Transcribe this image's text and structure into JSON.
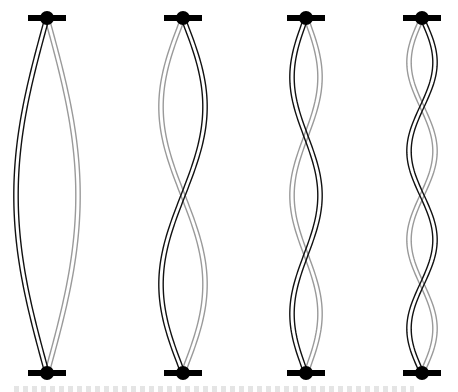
{
  "diagram": {
    "top_y": 18,
    "bottom_y": 373,
    "colors": {
      "phase_a": "#111111",
      "phase_b": "#9a9a9a",
      "anchor": "#000000",
      "background": "#ffffff"
    },
    "modes": [
      {
        "id": "mode-1",
        "harmonic": 1,
        "center_x": 47,
        "amplitude": 31,
        "first_lobe_black_side": "left"
      },
      {
        "id": "mode-2",
        "harmonic": 2,
        "center_x": 183,
        "amplitude": 22,
        "first_lobe_black_side": "right"
      },
      {
        "id": "mode-3",
        "harmonic": 3,
        "center_x": 306,
        "amplitude": 14,
        "first_lobe_black_side": "left"
      },
      {
        "id": "mode-4",
        "harmonic": 4,
        "center_x": 422,
        "amplitude": 13,
        "first_lobe_black_side": "right"
      }
    ],
    "anchor": {
      "bar_half_width": 19,
      "bar_height": 6,
      "dot_radius": 7
    }
  },
  "caption": {
    "visible": "clipped",
    "text": ""
  }
}
